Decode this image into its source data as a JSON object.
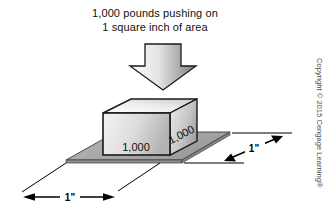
{
  "figure": {
    "name": "pressure-1000-pounds-on-1-square-inch",
    "background_color": "#ffffff",
    "caption": {
      "line1": "1,000 pounds pushing on",
      "line2": "1 square inch of area"
    },
    "arrow": {
      "name": "downward-force-arrow",
      "direction": "down",
      "gradient_from": "#ffffff",
      "gradient_to": "#7d7d7d",
      "stroke_color": "#1a1a1a"
    },
    "cube": {
      "name": "force-cube",
      "front_face_label": "1,000",
      "right_face_label": "1,000",
      "front_face_gradient_from": "#f2f2f2",
      "front_face_gradient_to": "#b9b9b9",
      "right_face_gradient_from": "#e8e8e8",
      "right_face_gradient_to": "#a9a9a9",
      "top_face_gradient_from": "#ffffff",
      "top_face_gradient_to": "#d2d2d2",
      "edge_color": "#1a1a1a"
    },
    "base_plane": {
      "name": "ground-plane",
      "top_color": "#a8a8a8",
      "edge_color": "#8a8a8a",
      "side_color": "#9a9a9a",
      "outline_color": "#1a1a1a"
    },
    "dimensions": [
      {
        "name": "width-dimension",
        "label": "1\"",
        "orientation": "horizontal",
        "position": "bottom-left"
      },
      {
        "name": "depth-dimension",
        "label": "1\"",
        "orientation": "diagonal",
        "position": "right"
      }
    ],
    "copyright": "Copyright © 2015 Cengage Learning®"
  }
}
